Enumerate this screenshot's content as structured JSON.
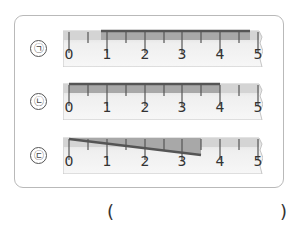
{
  "question": {
    "rows": [
      {
        "label": "㉠",
        "bar": {
          "type": "straight",
          "start": 0.85,
          "end": 4.8
        }
      },
      {
        "label": "㉡",
        "bar": {
          "type": "straight",
          "start": 0,
          "end": 4
        }
      },
      {
        "label": "㉢",
        "bar": {
          "type": "slanted",
          "start": 0,
          "end": 3.5
        }
      }
    ],
    "ruler": {
      "min": 0,
      "max": 5,
      "tick_labels": [
        "0",
        "1",
        "2",
        "3",
        "4",
        "5"
      ],
      "minor_ticks_per_unit": 2
    },
    "answer": {
      "open_paren": "(",
      "close_paren": ")",
      "value": ""
    }
  },
  "colors": {
    "frame_border": "#b9b9b9",
    "ruler_body": "#f2f2f2",
    "ruler_band": "#cfcfcf",
    "bar": "#555555",
    "bar_fill": "#9a9a9a"
  }
}
